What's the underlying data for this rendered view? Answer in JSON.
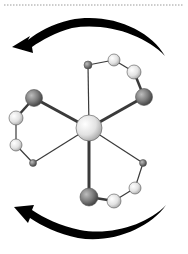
{
  "diagram": {
    "title": "",
    "colors": {
      "background": "#ffffff",
      "dotted_line": "#9a9a9a",
      "arrow": "#000000",
      "bond": "#3a3a3a",
      "atom_light": "#e6e6e6",
      "atom_dark": "#7a7a7a",
      "atom_center": "#e0e0e0"
    },
    "atoms": [
      {
        "id": "center",
        "x": 89,
        "y": 128,
        "r": 13,
        "type": "light"
      },
      {
        "id": "top-small",
        "x": 88,
        "y": 65,
        "r": 4,
        "type": "dark"
      },
      {
        "id": "top-right",
        "x": 114,
        "y": 60,
        "r": 6,
        "type": "light"
      },
      {
        "id": "right-light",
        "x": 134,
        "y": 72,
        "r": 7,
        "type": "light"
      },
      {
        "id": "right-dark",
        "x": 144,
        "y": 97,
        "r": 8.5,
        "type": "dark"
      },
      {
        "id": "left-dark",
        "x": 34,
        "y": 98,
        "r": 8.5,
        "type": "dark"
      },
      {
        "id": "left-light-upper",
        "x": 16,
        "y": 118,
        "r": 7,
        "type": "light"
      },
      {
        "id": "left-light-lower",
        "x": 16,
        "y": 145,
        "r": 6,
        "type": "light"
      },
      {
        "id": "left-small",
        "x": 33,
        "y": 163,
        "r": 3.5,
        "type": "dark"
      },
      {
        "id": "bottom-dark",
        "x": 89,
        "y": 197,
        "r": 9,
        "type": "dark"
      },
      {
        "id": "bottom-light",
        "x": 114,
        "y": 201,
        "r": 7,
        "type": "light"
      },
      {
        "id": "bottom-right-light",
        "x": 135,
        "y": 188,
        "r": 6,
        "type": "light"
      },
      {
        "id": "bottom-right-small",
        "x": 143,
        "y": 163,
        "r": 3.5,
        "type": "dark"
      }
    ],
    "bonds": [
      {
        "from": "center",
        "to": "top-small",
        "width": 1.2
      },
      {
        "from": "center",
        "to": "right-dark",
        "width": 3
      },
      {
        "from": "center",
        "to": "left-dark",
        "width": 3
      },
      {
        "from": "center",
        "to": "left-small",
        "width": 1.2
      },
      {
        "from": "center",
        "to": "bottom-dark",
        "width": 3
      },
      {
        "from": "center",
        "to": "bottom-right-small",
        "width": 1.2
      },
      {
        "from": "top-small",
        "to": "top-right",
        "width": 1.2
      },
      {
        "from": "top-right",
        "to": "right-light",
        "width": 1.2
      },
      {
        "from": "right-light",
        "to": "right-dark",
        "width": 2.5
      },
      {
        "from": "left-dark",
        "to": "left-light-upper",
        "width": 2.5
      },
      {
        "from": "left-light-upper",
        "to": "left-light-lower",
        "width": 1.2
      },
      {
        "from": "left-light-lower",
        "to": "left-small",
        "width": 1.2
      },
      {
        "from": "bottom-dark",
        "to": "bottom-light",
        "width": 2.5
      },
      {
        "from": "bottom-light",
        "to": "bottom-right-light",
        "width": 1.2
      },
      {
        "from": "bottom-right-light",
        "to": "bottom-right-small",
        "width": 1.2
      }
    ],
    "arrows": [
      {
        "id": "top-arrow",
        "direction": "counter-clockwise-left"
      },
      {
        "id": "bottom-arrow",
        "direction": "clockwise-left"
      }
    ]
  }
}
